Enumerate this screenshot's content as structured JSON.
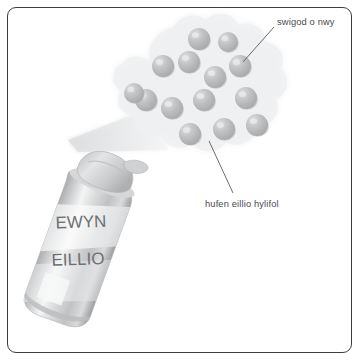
{
  "figure": {
    "background_color": "#ffffff",
    "border_color": "#3b3b44"
  },
  "can": {
    "brand_line_1": "EWYN",
    "brand_line_2": "EILLIO",
    "body_color": "#c9cbcd",
    "highlight_color": "#f2f3f4",
    "cap_color": "#d2d4d6",
    "tilt_degrees": 20
  },
  "spray": {
    "name": "spray-cone",
    "color": "#eeeff0"
  },
  "cloud": {
    "name": "foam-cloud",
    "fill_color": "#f0f1f2",
    "bubble_color": "#b8babc",
    "bubble_count": 14,
    "bubbles": [
      {
        "cx": 199,
        "cy": 39,
        "r": 11
      },
      {
        "cx": 228,
        "cy": 42,
        "r": 10
      },
      {
        "cx": 189,
        "cy": 62,
        "r": 11
      },
      {
        "cx": 163,
        "cy": 66,
        "r": 11
      },
      {
        "cx": 215,
        "cy": 77,
        "r": 11
      },
      {
        "cx": 240,
        "cy": 66,
        "r": 11
      },
      {
        "cx": 146,
        "cy": 100,
        "r": 11
      },
      {
        "cx": 172,
        "cy": 108,
        "r": 11
      },
      {
        "cx": 204,
        "cy": 100,
        "r": 11
      },
      {
        "cx": 246,
        "cy": 98,
        "r": 11
      },
      {
        "cx": 190,
        "cy": 134,
        "r": 11
      },
      {
        "cx": 224,
        "cy": 129,
        "r": 11
      },
      {
        "cx": 257,
        "cy": 125,
        "r": 11
      },
      {
        "cx": 134,
        "cy": 93,
        "r": 10
      }
    ]
  },
  "annotations": [
    {
      "id": "gas-bubble",
      "text": "swigod o nwy",
      "leader": {
        "x1": 274,
        "y1": 27,
        "x2": 243,
        "y2": 62
      }
    },
    {
      "id": "liquid-shaving-cream",
      "text": "hufen eillio hylifol",
      "leader": {
        "x1": 209,
        "y1": 141,
        "x2": 233,
        "y2": 193
      }
    }
  ],
  "colors": {
    "text": "#4a4a4f",
    "leader_line": "#5a5a60"
  }
}
